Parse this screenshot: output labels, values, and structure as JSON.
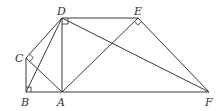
{
  "figure": {
    "type": "geometry",
    "points": {
      "A": {
        "label": "A",
        "x": 62,
        "y": 92
      },
      "B": {
        "label": "B",
        "x": 26,
        "y": 92
      },
      "C": {
        "label": "C",
        "x": 26,
        "y": 58
      },
      "D": {
        "label": "D",
        "x": 62,
        "y": 18
      },
      "E": {
        "label": "E",
        "x": 138,
        "y": 18
      },
      "F": {
        "label": "F",
        "x": 209,
        "y": 92
      }
    },
    "segments": [
      "DE",
      "DC",
      "DB",
      "DA",
      "DF",
      "CB",
      "CA",
      "BF",
      "AE",
      "EF"
    ],
    "right_angles": [
      "D",
      "C",
      "B",
      "E"
    ],
    "colors": {
      "line": "#3a3a3a",
      "label": "#333333",
      "background": "#ffffff"
    }
  }
}
